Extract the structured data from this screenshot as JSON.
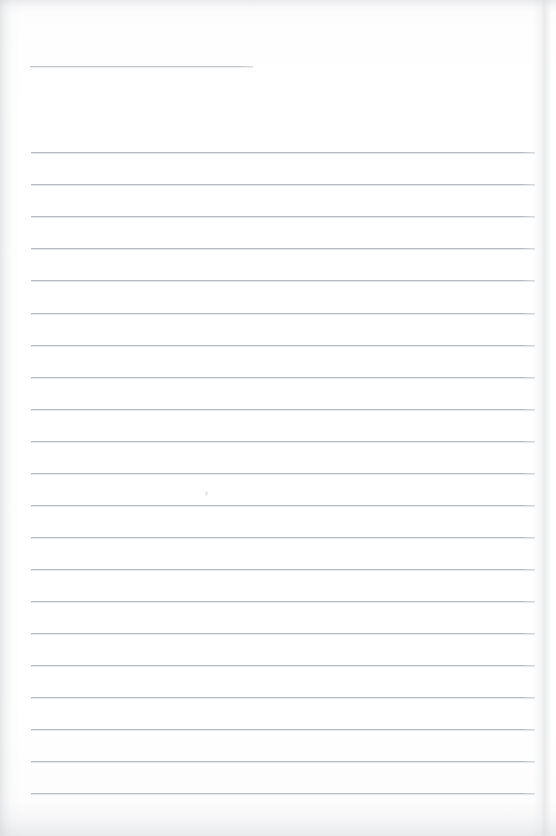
{
  "document": {
    "kind": "scanned-ruled-paper",
    "title": "",
    "visible_text": "",
    "page_width": 556,
    "page_height": 836,
    "background_color": "#fdfdfd",
    "rule_color": "#b9bdc1",
    "edge_shadow_color": "#c4c6ca"
  },
  "layout": {
    "rule_left_x": 31,
    "rule_right_x": 535,
    "rule_thickness": 1,
    "rule_spacing": 32.05,
    "first_rule_y": 152,
    "last_rule_y": 793,
    "page_edge_right_x": 533
  },
  "header_rule": {
    "name": "date-or-title-rule",
    "x": 30,
    "y": 66,
    "width": 223
  },
  "ruled_lines": [
    {
      "index": 1,
      "y": 152,
      "x": 31,
      "width": 504
    },
    {
      "index": 2,
      "y": 184,
      "x": 31,
      "width": 504
    },
    {
      "index": 3,
      "y": 216,
      "x": 31,
      "width": 504
    },
    {
      "index": 4,
      "y": 248,
      "x": 31,
      "width": 504
    },
    {
      "index": 5,
      "y": 280,
      "x": 31,
      "width": 504
    },
    {
      "index": 6,
      "y": 313,
      "x": 31,
      "width": 504
    },
    {
      "index": 7,
      "y": 345,
      "x": 31,
      "width": 504
    },
    {
      "index": 8,
      "y": 377,
      "x": 31,
      "width": 504
    },
    {
      "index": 9,
      "y": 409,
      "x": 31,
      "width": 504
    },
    {
      "index": 10,
      "y": 441,
      "x": 31,
      "width": 504
    },
    {
      "index": 11,
      "y": 473,
      "x": 31,
      "width": 504
    },
    {
      "index": 12,
      "y": 505,
      "x": 31,
      "width": 504
    },
    {
      "index": 13,
      "y": 537,
      "x": 31,
      "width": 504
    },
    {
      "index": 14,
      "y": 569,
      "x": 31,
      "width": 504
    },
    {
      "index": 15,
      "y": 601,
      "x": 31,
      "width": 504
    },
    {
      "index": 16,
      "y": 633,
      "x": 31,
      "width": 504
    },
    {
      "index": 17,
      "y": 665,
      "x": 31,
      "width": 504
    },
    {
      "index": 18,
      "y": 697,
      "x": 31,
      "width": 504
    },
    {
      "index": 19,
      "y": 729,
      "x": 31,
      "width": 504
    },
    {
      "index": 20,
      "y": 761,
      "x": 31,
      "width": 504
    },
    {
      "index": 21,
      "y": 793,
      "x": 31,
      "width": 504
    }
  ],
  "artifacts": [
    {
      "name": "faint-scan-speck",
      "x": 205,
      "y": 491,
      "width": 3,
      "height": 5
    }
  ]
}
